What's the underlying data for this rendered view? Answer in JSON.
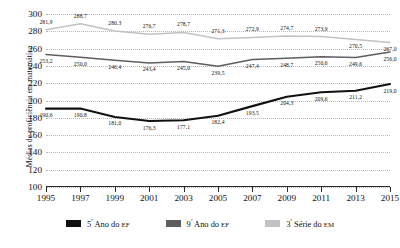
{
  "chart_data": {
    "type": "line",
    "title": "",
    "xlabel": "",
    "ylabel": "Médias de proficiência em matemática",
    "categories": [
      "1995",
      "1997",
      "1999",
      "2001",
      "2003",
      "2005",
      "2007",
      "2009",
      "2011",
      "2013",
      "2015"
    ],
    "ylim": [
      100,
      300
    ],
    "ytick_step": 20,
    "yticks": [
      "300",
      "280",
      "260",
      "240",
      "220",
      "200",
      "180",
      "160",
      "140",
      "120",
      "100"
    ],
    "grid": true,
    "legend_position": "bottom",
    "series": [
      {
        "name": "5º Ano do EF",
        "color": "#111111",
        "values": [
          190.6,
          190.8,
          181.0,
          176.3,
          177.1,
          182.4,
          193.5,
          204.3,
          209.6,
          211.2,
          219.0
        ],
        "labels": [
          "190,6",
          "190,8",
          "181,0",
          "176,3",
          "177,1",
          "182,4",
          "193,5",
          "204,3",
          "209,6",
          "211,2",
          "219,0"
        ]
      },
      {
        "name": "9º Ano do EF",
        "color": "#5e5e5e",
        "values": [
          253.2,
          250.0,
          246.4,
          243.4,
          245.0,
          239.5,
          247.4,
          248.7,
          250.6,
          249.6,
          256.0
        ],
        "labels": [
          "253,2",
          "250,0",
          "246,4",
          "243,4",
          "245,0",
          "239,5",
          "247,4",
          "248,7",
          "250,6",
          "249,6",
          "256,0"
        ]
      },
      {
        "name": "3ª Série do EM",
        "color": "#c2c2c2",
        "values": [
          281.9,
          288.7,
          280.3,
          276.7,
          278.7,
          271.3,
          272.9,
          274.7,
          273.9,
          270.5,
          267.0
        ],
        "labels": [
          "281,9",
          "288,7",
          "280,3",
          "276,7",
          "278,7",
          "271,3",
          "272,9",
          "274,7",
          "273,9",
          "270,5",
          "267,0"
        ]
      }
    ]
  },
  "legend": {
    "items": [
      {
        "ordinal": "5",
        "sup": "º",
        "rest_a": " Ano do ",
        "rest_b": "EF"
      },
      {
        "ordinal": "9",
        "sup": "º",
        "rest_a": " Ano do ",
        "rest_b": "EF"
      },
      {
        "ordinal": "3",
        "sup": "ª",
        "rest_a": " Série do ",
        "rest_b": "EM"
      }
    ]
  }
}
